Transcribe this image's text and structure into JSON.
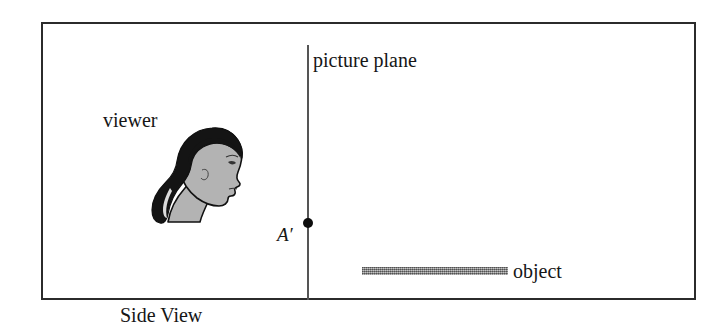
{
  "figure": {
    "caption": "Side View",
    "frame": {
      "border_color": "#2b2b2b",
      "background": "#ffffff"
    }
  },
  "labels": {
    "picture_plane": "picture plane",
    "viewer": "viewer",
    "object": "object",
    "point_a_prime": "A′"
  },
  "elements": {
    "picture_plane_line": {
      "color": "#555555",
      "orientation": "vertical"
    },
    "point_a_prime_dot": {
      "color": "#0d0d0d",
      "shape": "filled-circle"
    },
    "object_bar": {
      "color": "#8e8e8e",
      "shape": "horizontal-bar"
    },
    "viewer_head": {
      "hair_color": "#141414",
      "skin_color": "#b3b3b3",
      "outline_color": "#111111",
      "facing": "right"
    }
  }
}
